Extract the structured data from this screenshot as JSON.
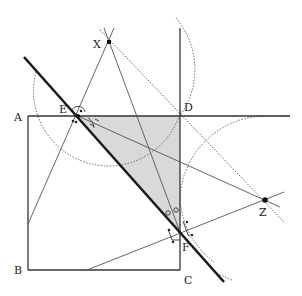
{
  "diagram": {
    "type": "geometry-construction",
    "points": {
      "A": {
        "label": "A",
        "x": 28,
        "y": 116
      },
      "B": {
        "label": "B",
        "x": 28,
        "y": 270
      },
      "C": {
        "label": "C",
        "x": 180,
        "y": 270
      },
      "D": {
        "label": "D",
        "x": 180,
        "y": 116
      },
      "E": {
        "label": "E",
        "x": 78,
        "y": 116
      },
      "F": {
        "label": "F",
        "x": 180,
        "y": 232
      },
      "X": {
        "label": "X",
        "x": 109,
        "y": 42
      },
      "Z": {
        "label": "Z",
        "x": 265,
        "y": 200
      }
    },
    "labels": {
      "A": "A",
      "B": "B",
      "C": "C",
      "D": "D",
      "E": "E",
      "F": "F",
      "X": "X",
      "Z": "Z"
    },
    "shaded_region": "triangle EDF",
    "colors": {
      "stroke": "#222222",
      "thin_stroke": "#555555",
      "shade": "#d9d9d9",
      "dotted": "#666666"
    }
  }
}
